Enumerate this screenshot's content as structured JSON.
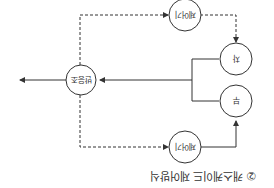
{
  "orientation": "rotated-180",
  "caption": "② 캐스케이드 제어방식",
  "nodes": {
    "controller_top": "제어기",
    "controller_bottom": "제어기",
    "primary": "차",
    "secondary": "부",
    "process": "반응조"
  },
  "colors": {
    "line": "#333333",
    "background": "#ffffff"
  }
}
